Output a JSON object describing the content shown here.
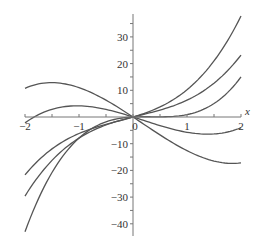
{
  "chart_data": {
    "type": "line",
    "title": "",
    "xlabel": "x",
    "ylabel": "",
    "xlim": [
      -2,
      2
    ],
    "ylim": [
      -43,
      37
    ],
    "grid": false,
    "legend": "none",
    "x_ticks": [
      -2,
      -1,
      0,
      1,
      2
    ],
    "x_tick_labels": [
      "−2",
      "−1",
      "0",
      "1",
      "2"
    ],
    "y_ticks": [
      30,
      20,
      10,
      -10,
      -20,
      -30,
      -40
    ],
    "y_tick_labels": [
      "30",
      "20",
      "10",
      "−10",
      "−20",
      "−30",
      "−40"
    ],
    "line_color": "#555555",
    "series": [
      {
        "name": "curve-1",
        "x": [
          -2,
          -1,
          0,
          1,
          2
        ],
        "y": [
          -21.7,
          -6.2,
          0,
          10.2,
          37.8
        ]
      },
      {
        "name": "curve-2",
        "x": [
          -2,
          -1,
          0,
          1,
          2
        ],
        "y": [
          -29.6,
          -7.9,
          0,
          6.3,
          23.2
        ]
      },
      {
        "name": "curve-3",
        "x": [
          -2,
          -1,
          0,
          1,
          2
        ],
        "y": [
          -43,
          -7.9,
          0,
          0.9,
          15
        ]
      },
      {
        "name": "curve-4",
        "x": [
          -2,
          -1,
          0,
          1,
          2
        ],
        "y": [
          10.9,
          10.3,
          0,
          -13.3,
          -17
        ]
      },
      {
        "name": "curve-5",
        "x": [
          -2,
          -1,
          0,
          1,
          2
        ],
        "y": [
          -2.2,
          4.2,
          0,
          -5.7,
          -4
        ]
      }
    ]
  }
}
